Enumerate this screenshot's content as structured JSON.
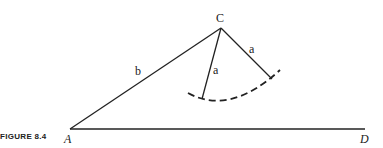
{
  "caption": "FIGURE 8.4",
  "points": {
    "A": {
      "label": "A",
      "x": 70,
      "y": 129
    },
    "C": {
      "label": "C",
      "x": 221,
      "y": 28
    },
    "D": {
      "label": "D",
      "x": 365,
      "y": 129
    }
  },
  "segments": {
    "b": {
      "label": "b"
    },
    "a_left": {
      "label": "a"
    },
    "a_right": {
      "label": "a"
    }
  },
  "colors": {
    "stroke": "#222222",
    "background": "#ffffff"
  }
}
